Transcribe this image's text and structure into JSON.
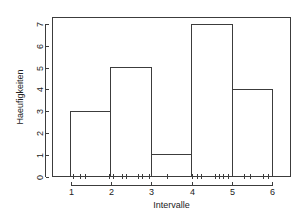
{
  "chart_data": {
    "type": "bar",
    "title": "",
    "subtitle": "",
    "xlabel": "Intervalle",
    "ylabel": "Haeufigkeiten",
    "categories": [
      "1-2",
      "2-3",
      "3-4",
      "4-5",
      "5-6"
    ],
    "bin_edges": [
      1,
      2,
      3,
      4,
      5,
      6
    ],
    "values": [
      3,
      5,
      1,
      7,
      4
    ],
    "xlim": [
      0.55,
      6.45
    ],
    "ylim": [
      0,
      7.3
    ],
    "xticks": [
      1,
      2,
      3,
      4,
      5,
      6
    ],
    "xtick_labels": [
      "1",
      "2",
      "3",
      "4",
      "5",
      "6"
    ],
    "yticks": [
      0,
      1,
      2,
      3,
      4,
      5,
      6,
      7
    ],
    "ytick_labels": [
      "0",
      "1",
      "2",
      "3",
      "4",
      "5",
      "6",
      "7"
    ],
    "grid": false,
    "legend": null,
    "legend_position": "none",
    "bar_fill": "none",
    "bar_outline_color": "#3c3c3c",
    "background_color": "#ffffff",
    "frame": "box",
    "rug": {
      "present": true,
      "y": 0,
      "values": [
        1.05,
        1.22,
        1.36,
        1.95,
        2.05,
        2.28,
        2.38,
        2.66,
        2.76,
        2.95,
        3.38,
        4.02,
        4.12,
        4.22,
        4.58,
        4.68,
        4.78,
        4.9,
        5.3,
        5.44,
        5.78,
        5.9
      ]
    }
  },
  "axis": {
    "y_label": "Haeufigkeiten",
    "x_label": "Intervalle"
  }
}
